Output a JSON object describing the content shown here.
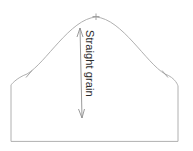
{
  "diagram": {
    "kind": "sewing-pattern-sleeve-cap",
    "background_color": "#ffffff",
    "outline_color": "#b0b0b0",
    "notch_color": "#9a9a9a",
    "grain_line_color": "#8f8f8f",
    "label_color": "#2b2b2b",
    "grain_label": "Straight grain",
    "outline_path": "M 11 141 L 11 85 C 11 85 16 78 27 74 C 46 63 70 19 96 17 C 122 19 146 63 165 74 C 176 78 178 86 178 86 L 178 141 Z",
    "grain_line": {
      "x1": 80,
      "y1": 28,
      "x2": 82,
      "y2": 118
    },
    "marks": [
      {
        "name": "apex-notch",
        "x": 96,
        "y": 16,
        "angle_deg": 0,
        "length": 7
      },
      {
        "name": "left-notch",
        "x": 29,
        "y": 74,
        "angle_deg": 62,
        "length": 7
      },
      {
        "name": "right-notch",
        "x": 165,
        "y": 74,
        "angle_deg": -62,
        "length": 7
      }
    ],
    "dimensions": {
      "width": 193,
      "height": 151
    }
  }
}
